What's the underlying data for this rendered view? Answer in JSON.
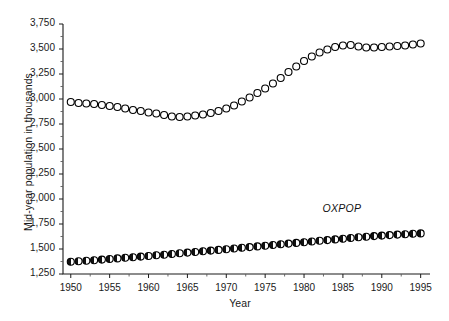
{
  "chart_data": {
    "type": "scatter",
    "title": "",
    "xlabel": "Year",
    "ylabel": "Mid-year population in thousands",
    "xlim": [
      1949,
      1996
    ],
    "ylim": [
      1250,
      3750
    ],
    "xticks": [
      1950,
      1955,
      1960,
      1965,
      1970,
      1975,
      1980,
      1985,
      1990,
      1995
    ],
    "xtick_labels": [
      "1950",
      "1955",
      "1960",
      "1965",
      "1970",
      "1975",
      "1980",
      "1985",
      "1990",
      "1995"
    ],
    "yticks": [
      1250,
      1500,
      1750,
      2000,
      2250,
      2500,
      2750,
      3000,
      3250,
      3500,
      3750
    ],
    "ytick_labels": [
      "1,250",
      "1,500",
      "1,750",
      "2,000",
      "2,250",
      "2,500",
      "2,750",
      "3,000",
      "3,250",
      "3,500",
      "3,750"
    ],
    "grid": false,
    "minor_ticks": true,
    "legend_position": "inline-annotation",
    "annotations": [
      {
        "text": "OXPOP",
        "x": 1987,
        "y": 1900,
        "style": "italic",
        "series": "lower"
      }
    ],
    "x": [
      1950,
      1951,
      1952,
      1953,
      1954,
      1955,
      1956,
      1957,
      1958,
      1959,
      1960,
      1961,
      1962,
      1963,
      1964,
      1965,
      1966,
      1967,
      1968,
      1969,
      1970,
      1971,
      1972,
      1973,
      1974,
      1975,
      1976,
      1977,
      1978,
      1979,
      1980,
      1981,
      1982,
      1983,
      1984,
      1985,
      1986,
      1987,
      1988,
      1989,
      1990,
      1991,
      1992,
      1993,
      1994,
      1995
    ],
    "series": [
      {
        "name": "upper-open-circles",
        "marker": "open-circle",
        "color": "#000000",
        "fill": "#ffffff",
        "values": [
          2970,
          2960,
          2955,
          2950,
          2940,
          2930,
          2920,
          2905,
          2890,
          2880,
          2865,
          2855,
          2840,
          2825,
          2820,
          2825,
          2835,
          2845,
          2860,
          2880,
          2905,
          2935,
          2975,
          3015,
          3060,
          3105,
          3155,
          3210,
          3270,
          3325,
          3380,
          3425,
          3465,
          3495,
          3520,
          3535,
          3540,
          3525,
          3515,
          3515,
          3520,
          3525,
          3530,
          3535,
          3545,
          3555
        ]
      },
      {
        "name": "OXPOP",
        "marker": "half-filled-circle",
        "color": "#000000",
        "fill": "#111111",
        "values": [
          1372,
          1377,
          1382,
          1388,
          1394,
          1400,
          1406,
          1412,
          1418,
          1424,
          1430,
          1437,
          1443,
          1450,
          1457,
          1464,
          1470,
          1477,
          1484,
          1491,
          1498,
          1505,
          1512,
          1519,
          1526,
          1533,
          1540,
          1547,
          1554,
          1561,
          1568,
          1575,
          1582,
          1589,
          1596,
          1603,
          1610,
          1617,
          1623,
          1629,
          1634,
          1639,
          1644,
          1648,
          1652,
          1656
        ]
      }
    ]
  }
}
